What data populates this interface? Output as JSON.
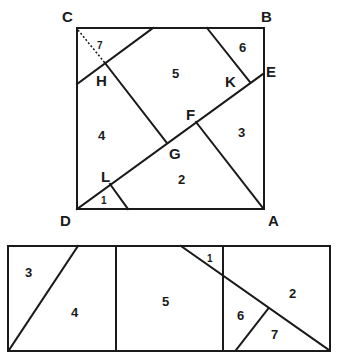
{
  "figure": {
    "title": "",
    "square": {
      "vertices": {
        "C": "C",
        "B": "B",
        "E": "E",
        "D": "D",
        "A": "A",
        "H": "H",
        "K": "K",
        "F": "F",
        "G": "G",
        "L": "L"
      },
      "pieces": [
        "1",
        "2",
        "3",
        "4",
        "5",
        "6",
        "7"
      ]
    },
    "rectangle": {
      "pieces": [
        "3",
        "4",
        "5",
        "1",
        "2",
        "6",
        "7"
      ]
    }
  }
}
